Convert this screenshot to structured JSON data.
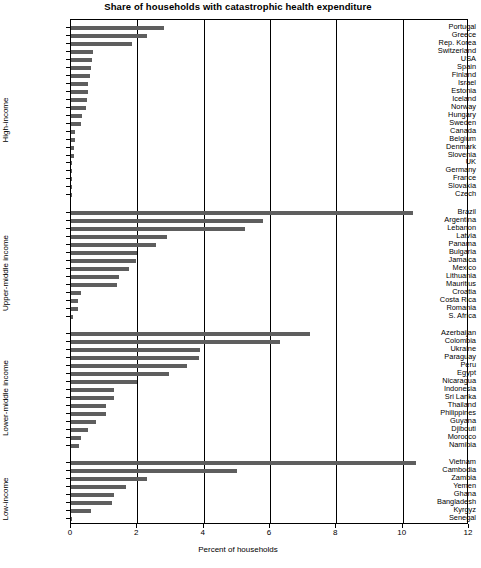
{
  "chart_data": {
    "type": "bar",
    "orientation": "horizontal",
    "title": "Share of households with catastrophic health expenditure",
    "xlabel": "Percent of households",
    "ylabel": "",
    "xlim": [
      0,
      12
    ],
    "xticks": [
      0,
      2,
      4,
      6,
      8,
      10,
      12
    ],
    "xticklabels": [
      "0",
      "2",
      "4",
      "6",
      "8",
      "10",
      "12"
    ],
    "grid": "vertical",
    "legend": "none",
    "bar_color": "#5e5e5e",
    "groups": [
      {
        "name": "High-income",
        "categories": [
          "Portugal",
          "Greece",
          "Rep. Korea",
          "Switzerland",
          "USA",
          "Spain",
          "Finland",
          "Israel",
          "Estonia",
          "Iceland",
          "Norway",
          "Hungary",
          "Sweden",
          "Canada",
          "Belgium",
          "Denmark",
          "Slovenia",
          "UK",
          "Germany",
          "France",
          "Slovakia",
          "Czech"
        ],
        "values": [
          2.8,
          2.3,
          1.85,
          0.65,
          0.62,
          0.6,
          0.58,
          0.52,
          0.5,
          0.48,
          0.45,
          0.34,
          0.3,
          0.13,
          0.12,
          0.1,
          0.08,
          0.03,
          0.02,
          0.02,
          0.02,
          0.02
        ]
      },
      {
        "name": "Upper-middle income",
        "categories": [
          "Brazil",
          "Argentina",
          "Lebanon",
          "Latvia",
          "Panama",
          "Bulgaria",
          "Jamaica",
          "Mexico",
          "Lithuania",
          "Mauritius",
          "Croatia",
          "Costa Rica",
          "Romania",
          "S. Africa"
        ],
        "values": [
          10.3,
          5.8,
          5.25,
          2.9,
          2.55,
          2.0,
          1.95,
          1.75,
          1.45,
          1.4,
          0.3,
          0.2,
          0.2,
          0.07
        ]
      },
      {
        "name": "Lower-middle income",
        "categories": [
          "Azerbaijan",
          "Colombia",
          "Ukraine",
          "Paraguay",
          "Peru",
          "Egypt",
          "Nicaragua",
          "Indonesia",
          "Sri Lanka",
          "Thailand",
          "Philippines",
          "Guyana",
          "Djibouti",
          "Morocco",
          "Namibia"
        ],
        "values": [
          7.2,
          6.3,
          3.9,
          3.85,
          3.5,
          2.95,
          2.0,
          1.3,
          1.3,
          1.05,
          1.05,
          0.75,
          0.5,
          0.3,
          0.25
        ]
      },
      {
        "name": "Low-income",
        "categories": [
          "Vietnam",
          "Cambodia",
          "Zambia",
          "Yemen",
          "Ghana",
          "Bangladesh",
          "Kyrgyz",
          "Senegal"
        ],
        "values": [
          10.4,
          5.0,
          2.3,
          1.65,
          1.3,
          1.25,
          0.6,
          0.03
        ]
      }
    ]
  }
}
